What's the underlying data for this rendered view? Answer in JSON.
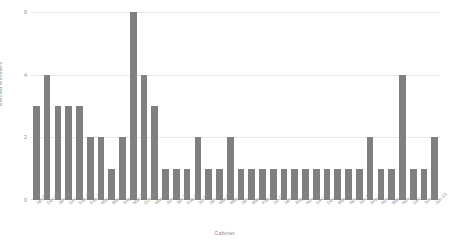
{
  "chart_data": {
    "type": "bar",
    "title": "",
    "xlabel": "Cabinet",
    "ylabel": "Elected Ministers",
    "ylim": [
      0,
      6
    ],
    "yticks": [
      0,
      2,
      4,
      6
    ],
    "grid": true,
    "legend": false,
    "bar_color": "#808080",
    "grid_color": "#e9e9e9",
    "axis_text_color": "#8c8c8c",
    "categories": [
      "Jan-63",
      "Dec-64",
      "Jan-66",
      "Dec-68",
      "Feb-70",
      "Feb-71",
      "Mar-72",
      "Mar-73",
      "Sep-74",
      "Mar-75",
      "Oct-06",
      "Mar-08",
      "Jun-09",
      "Jan-10",
      "Feb-05",
      "Jul-05",
      "Jan-06",
      "Mar-06",
      "May-06",
      "Jan-08",
      "Mar-11",
      "Feb-12",
      "Jul-12",
      "Jan-13",
      "Aug-13",
      "Nov-13",
      "Dec-13",
      "Dec-14",
      "Mar-15",
      "Apr-15",
      "Jun-15",
      "Sep-15",
      "Nov-15",
      "Mar-16",
      "Nov-17",
      "Dec-18",
      "Jun-21",
      "Jun-23"
    ],
    "values": [
      3,
      4,
      3,
      3,
      3,
      2,
      2,
      1,
      2,
      6,
      4,
      3,
      1,
      1,
      1,
      2,
      1,
      1,
      2,
      1,
      1,
      1,
      1,
      1,
      1,
      1,
      1,
      1,
      1,
      1,
      1,
      2,
      1,
      1,
      4,
      1,
      1,
      2
    ]
  }
}
